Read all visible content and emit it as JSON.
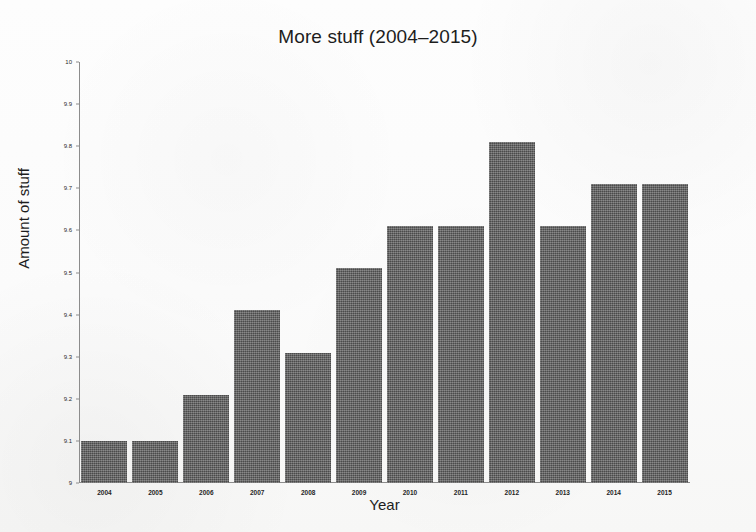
{
  "chart_data": {
    "type": "bar",
    "title": "More stuff (2004–2015)",
    "xlabel": "Year",
    "ylabel": "Amount of stuff",
    "categories": [
      "2004",
      "2005",
      "2006",
      "2007",
      "2008",
      "2009",
      "2010",
      "2011",
      "2012",
      "2013",
      "2014",
      "2015"
    ],
    "values": [
      9.1,
      9.1,
      9.21,
      9.41,
      9.31,
      9.51,
      9.61,
      9.61,
      9.81,
      9.61,
      9.71,
      9.71
    ],
    "ylim": [
      9,
      10
    ],
    "ytick_labels": [
      "9",
      "9.1",
      "9.2",
      "9.3",
      "9.4",
      "9.5",
      "9.6",
      "9.7",
      "9.8",
      "9.9",
      "10"
    ],
    "ytick_values": [
      9,
      9.1,
      9.2,
      9.3,
      9.4,
      9.5,
      9.6,
      9.7,
      9.8,
      9.9,
      10
    ],
    "grid": false,
    "legend": null,
    "bar_color": "#5b5b5b",
    "axis_color": "#8c8c8c"
  }
}
